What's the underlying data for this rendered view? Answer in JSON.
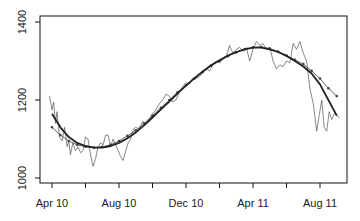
{
  "chart_data": {
    "type": "line",
    "title": "",
    "xlabel": "",
    "ylabel": "",
    "ylim": [
      990,
      1405
    ],
    "xlim_months": [
      -0.7,
      17.6
    ],
    "grid": false,
    "legend": null,
    "y_ticks": [
      1000,
      1200,
      1400
    ],
    "x_tick_months": [
      0,
      2,
      4,
      6,
      8,
      10,
      12,
      14,
      16
    ],
    "x_tick_labels": [
      {
        "month": 0,
        "label": "Apr 10"
      },
      {
        "month": 4,
        "label": "Aug 10"
      },
      {
        "month": 8,
        "label": "Dec 10"
      },
      {
        "month": 12,
        "label": "Apr 11"
      },
      {
        "month": 16,
        "label": "Aug 11"
      }
    ],
    "series": [
      {
        "name": "raw",
        "style": "thin",
        "color": "#555555",
        "x": [
          -0.15,
          0.0,
          0.1,
          0.2,
          0.3,
          0.45,
          0.6,
          0.75,
          0.9,
          1.0,
          1.1,
          1.25,
          1.4,
          1.55,
          1.7,
          1.85,
          2.0,
          2.15,
          2.3,
          2.45,
          2.6,
          2.75,
          2.9,
          3.05,
          3.2,
          3.35,
          3.5,
          3.65,
          3.8,
          3.95,
          4.1,
          4.25,
          4.4,
          4.55,
          4.7,
          4.85,
          5.0,
          5.2,
          5.4,
          5.6,
          5.8,
          6.0,
          6.2,
          6.4,
          6.6,
          6.8,
          7.0,
          7.2,
          7.4,
          7.6,
          7.8,
          8.0,
          8.2,
          8.4,
          8.6,
          8.8,
          9.0,
          9.2,
          9.4,
          9.6,
          9.8,
          10.0,
          10.2,
          10.4,
          10.6,
          10.8,
          11.0,
          11.2,
          11.4,
          11.6,
          11.8,
          12.0,
          12.2,
          12.4,
          12.6,
          12.8,
          13.0,
          13.2,
          13.4,
          13.6,
          13.8,
          14.0,
          14.2,
          14.4,
          14.6,
          14.8,
          15.0,
          15.2,
          15.4,
          15.6,
          15.8,
          15.95,
          16.1,
          16.25,
          16.4,
          16.55,
          16.7,
          16.85,
          17.0,
          17.15
        ],
        "values": [
          1210,
          1175,
          1195,
          1140,
          1170,
          1105,
          1095,
          1130,
          1080,
          1095,
          1060,
          1090,
          1070,
          1080,
          1065,
          1070,
          1105,
          1100,
          1060,
          1030,
          1050,
          1080,
          1090,
          1085,
          1110,
          1110,
          1080,
          1100,
          1085,
          1070,
          1055,
          1045,
          1070,
          1090,
          1100,
          1125,
          1130,
          1125,
          1145,
          1140,
          1150,
          1165,
          1175,
          1190,
          1200,
          1215,
          1210,
          1195,
          1200,
          1220,
          1235,
          1245,
          1240,
          1255,
          1255,
          1260,
          1270,
          1280,
          1275,
          1290,
          1300,
          1295,
          1305,
          1310,
          1340,
          1320,
          1330,
          1335,
          1325,
          1335,
          1300,
          1330,
          1350,
          1340,
          1345,
          1330,
          1335,
          1300,
          1280,
          1290,
          1285,
          1300,
          1295,
          1345,
          1330,
          1350,
          1320,
          1300,
          1230,
          1190,
          1120,
          1160,
          1200,
          1130,
          1120,
          1170,
          1150,
          1165,
          1160,
          1155
        ]
      },
      {
        "name": "dotted smooth",
        "style": "line-with-points",
        "color": "#444444",
        "x": [
          0.0,
          0.5,
          1.0,
          1.5,
          2.0,
          2.5,
          3.0,
          3.5,
          4.0,
          4.5,
          5.0,
          5.5,
          6.0,
          6.5,
          7.0,
          7.5,
          8.0,
          8.5,
          9.0,
          9.5,
          10.0,
          10.5,
          11.0,
          11.5,
          12.0,
          12.5,
          13.0,
          13.5,
          14.0,
          14.5,
          15.0,
          15.5,
          16.0,
          16.5,
          17.0
        ],
        "values": [
          1130,
          1110,
          1095,
          1085,
          1080,
          1078,
          1080,
          1085,
          1095,
          1108,
          1122,
          1140,
          1160,
          1180,
          1200,
          1220,
          1238,
          1255,
          1272,
          1288,
          1300,
          1312,
          1322,
          1330,
          1335,
          1336,
          1332,
          1324,
          1314,
          1303,
          1292,
          1275,
          1255,
          1230,
          1210
        ]
      },
      {
        "name": "thick trend",
        "style": "thick",
        "color": "#222222",
        "x": [
          0.0,
          0.5,
          1.0,
          1.5,
          2.0,
          2.5,
          3.0,
          3.5,
          4.0,
          4.5,
          5.0,
          5.5,
          6.0,
          6.5,
          7.0,
          7.5,
          8.0,
          8.5,
          9.0,
          9.5,
          10.0,
          10.5,
          11.0,
          11.5,
          12.0,
          12.5,
          13.0,
          13.5,
          14.0,
          14.5,
          15.0,
          15.5,
          16.0,
          16.5,
          17.0
        ],
        "values": [
          1165,
          1130,
          1105,
          1090,
          1082,
          1078,
          1078,
          1082,
          1090,
          1102,
          1117,
          1135,
          1155,
          1176,
          1196,
          1217,
          1237,
          1256,
          1273,
          1289,
          1302,
          1314,
          1323,
          1330,
          1334,
          1334,
          1330,
          1323,
          1313,
          1300,
          1286,
          1268,
          1240,
          1200,
          1160
        ]
      }
    ]
  }
}
